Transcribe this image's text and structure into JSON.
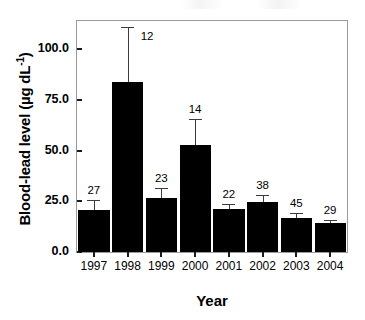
{
  "chart_data": {
    "type": "bar",
    "title": "",
    "xlabel": "Year",
    "ylabel_text": "Blood-lead level (µg dL",
    "ylabel_sup": "-1",
    "ylabel_tail": ")",
    "ylabel_plain": "Blood-lead level (µg dL-1)",
    "categories": [
      "1997",
      "1998",
      "1999",
      "2000",
      "2001",
      "2002",
      "2003",
      "2004"
    ],
    "values": [
      20.5,
      84.0,
      26.5,
      52.8,
      21.0,
      24.8,
      16.8,
      14.2
    ],
    "errors_upper": [
      25.8,
      111.0,
      31.5,
      65.5,
      23.8,
      28.0,
      19.2,
      15.8
    ],
    "sample_labels": [
      "27",
      "12",
      "23",
      "14",
      "22",
      "38",
      "45",
      "29"
    ],
    "ylim": [
      0,
      114
    ],
    "yticks": [
      "0.0",
      "25.0",
      "50.0",
      "75.0",
      "100.0"
    ],
    "ytick_values": [
      0,
      25,
      50,
      75,
      100
    ],
    "grid": false,
    "legend": false,
    "bar_color": "#000000",
    "error_color": "#3c3c3c",
    "axis_color": "#9a9a9a"
  }
}
